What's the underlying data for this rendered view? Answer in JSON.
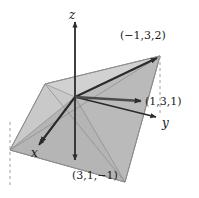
{
  "figure": {
    "background_color": "#ffffff",
    "axes": {
      "z": {
        "label": "z",
        "direction": "up"
      },
      "y": {
        "label": "y",
        "direction": "right"
      },
      "x": {
        "label": "x",
        "direction": "down-left"
      }
    },
    "points": [
      {
        "id": "a",
        "label": "(−1,3,2)",
        "x": -1,
        "y": 3,
        "z": 2
      },
      {
        "id": "b",
        "label": "(1,3,1)",
        "x": 1,
        "y": 3,
        "z": 1
      },
      {
        "id": "c",
        "label": "(3,1,−1)",
        "x": 3,
        "y": 1,
        "z": -1
      }
    ],
    "colors": {
      "plane_fill": "#b9b9b9",
      "plane_fill_light": "#cfcfcf",
      "plane_edge": "#8a8a8a",
      "vector": "#2b2b2b",
      "axis": "#2b2b2b",
      "dashed": "#9a9a9a",
      "text": "#1a1a1a"
    }
  }
}
